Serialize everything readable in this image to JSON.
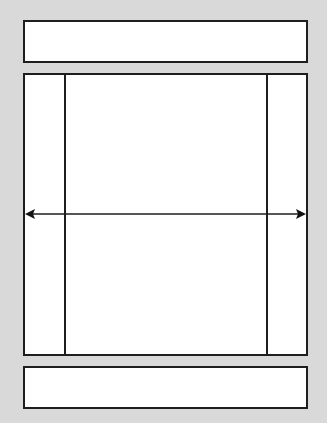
{
  "diagram": {
    "type": "page-layout-wireframe",
    "regions": [
      {
        "id": "header",
        "label": ""
      },
      {
        "id": "left-sidebar",
        "label": ""
      },
      {
        "id": "main-content",
        "label": ""
      },
      {
        "id": "right-sidebar",
        "label": ""
      },
      {
        "id": "footer",
        "label": ""
      }
    ],
    "annotation": {
      "type": "double-headed-arrow",
      "direction": "horizontal",
      "meaning": "full-width span"
    },
    "colors": {
      "background": "#d9d9d9",
      "box_fill": "#ffffff",
      "stroke": "#1e1e1e"
    }
  }
}
